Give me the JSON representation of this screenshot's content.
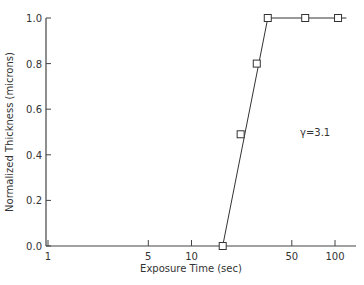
{
  "chart_data": {
    "type": "line",
    "title": "",
    "xlabel": "Exposure Time (sec)",
    "ylabel": "Normalized Thickness (microns)",
    "xscale": "log",
    "xlim": [
      1,
      130
    ],
    "ylim": [
      0.0,
      1.0
    ],
    "x_ticks": [
      1,
      5,
      10,
      50,
      100
    ],
    "x_tick_labels": [
      "1",
      "5",
      "10",
      "50",
      "100"
    ],
    "y_ticks": [
      0.0,
      0.2,
      0.4,
      0.6,
      0.8,
      1.0
    ],
    "y_tick_labels": [
      "0.0",
      "0.2",
      "0.4",
      "0.6",
      "0.8",
      "1.0"
    ],
    "grid": false,
    "legend": null,
    "annotation": "γ=3.1",
    "series": [
      {
        "name": "Normalized Thickness",
        "marker": "open-square",
        "x": [
          16.5,
          22,
          28.5,
          34,
          62,
          105
        ],
        "y": [
          0.0,
          0.49,
          0.8,
          1.0,
          1.0,
          1.0
        ]
      }
    ],
    "fit_line": {
      "x": [
        16.5,
        34,
        120
      ],
      "y": [
        0.0,
        1.0,
        1.0
      ]
    }
  }
}
